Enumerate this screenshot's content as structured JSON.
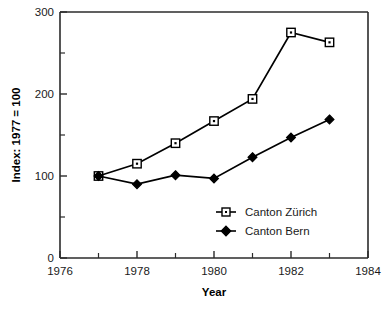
{
  "chart_data": {
    "type": "line",
    "title": "",
    "xlabel": "Year",
    "ylabel": "Index: 1977 = 100",
    "xlim": [
      1976,
      1984
    ],
    "ylim": [
      0,
      300
    ],
    "x": [
      1977,
      1978,
      1979,
      1980,
      1981,
      1982,
      1983
    ],
    "xticks": [
      1976,
      1978,
      1980,
      1982,
      1984
    ],
    "xticklabels": [
      "1976",
      "1978",
      "1980",
      "1982",
      "1984"
    ],
    "xminorticks": [
      1977,
      1979,
      1981,
      1983
    ],
    "yticks": [
      0,
      100,
      200,
      300
    ],
    "yticklabels": [
      "0",
      "100",
      "200",
      "300"
    ],
    "yminorticks": [
      50,
      150,
      250
    ],
    "grid": false,
    "legend_position": "lower right",
    "series": [
      {
        "name": "Canton Zürich",
        "marker": "open-square",
        "color": "#000000",
        "values": [
          100,
          115,
          140,
          167,
          194,
          275,
          263
        ]
      },
      {
        "name": "Canton Bern",
        "marker": "filled-diamond",
        "color": "#000000",
        "values": [
          100,
          90,
          101,
          97,
          123,
          147,
          169
        ]
      }
    ]
  },
  "legend": {
    "items": [
      {
        "label": "Canton Zürich",
        "marker": "open-square"
      },
      {
        "label": "Canton Bern",
        "marker": "filled-diamond"
      }
    ]
  },
  "axis": {
    "x_title": "Year",
    "y_title": "Index: 1977 = 100"
  }
}
